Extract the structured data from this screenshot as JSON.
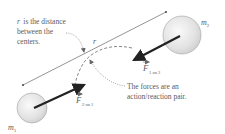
{
  "annotations": {
    "distance_note": [
      "r is the distance",
      "between the",
      "centers."
    ],
    "distance_note_var": "r",
    "pair_note": [
      "The forces are an",
      "action/reaction pair."
    ]
  },
  "labels": {
    "r": "r",
    "m1": "m",
    "m1_sub": "1",
    "m2": "m",
    "m2_sub": "2",
    "F12": "F",
    "F12_sub": "1 on 2",
    "F21": "F",
    "F21_sub": "2 on 1"
  },
  "colors": {
    "sphere_fill": "#e6e6e6",
    "sphere_stroke": "#9a9a9a",
    "arrow": "#222222",
    "line": "#555555",
    "text": "#5a5a5a"
  }
}
